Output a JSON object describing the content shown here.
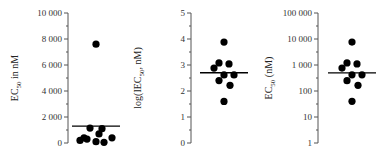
{
  "chart_data": [
    {
      "type": "scatter",
      "title": "",
      "ylabel": "EC50 in nM",
      "ylabel_parts": {
        "pre": "EC",
        "sub": "50",
        "post": " in nM"
      },
      "yscale": "linear",
      "ylim": [
        0,
        10000
      ],
      "yticks": [
        0,
        2000,
        4000,
        6000,
        8000,
        10000
      ],
      "ytick_labels": [
        "0",
        "2 000",
        "4 000",
        "6 000",
        "8 000",
        "10 000"
      ],
      "points": [
        7600,
        1150,
        1100,
        700,
        400,
        300,
        200,
        100,
        50,
        400
      ],
      "median_line": 1300,
      "grid": false
    },
    {
      "type": "scatter",
      "title": "",
      "ylabel": "log(IEC50, nM)",
      "ylabel_parts": {
        "pre": "log(IEC",
        "sub": "50",
        "post": ", nM)"
      },
      "yscale": "linear",
      "ylim": [
        0,
        5
      ],
      "yticks": [
        0,
        1,
        2,
        3,
        4,
        5
      ],
      "ytick_labels": [
        "0",
        "1",
        "2",
        "3",
        "4",
        "5"
      ],
      "points": [
        3.88,
        3.08,
        3.04,
        2.88,
        2.62,
        2.62,
        2.4,
        2.22,
        1.6
      ],
      "median_line": 2.7,
      "grid": false
    },
    {
      "type": "scatter",
      "title": "",
      "ylabel": "EC50 (nM)",
      "ylabel_parts": {
        "pre": "EC",
        "sub": "50",
        "post": " (nM)"
      },
      "yscale": "log",
      "ylim": [
        1,
        100000
      ],
      "yticks": [
        1,
        10,
        100,
        1000,
        10000,
        100000
      ],
      "ytick_labels": [
        "1",
        "10",
        "100",
        "1 000",
        "10 000",
        "100 000"
      ],
      "points": [
        7600,
        1200,
        1100,
        760,
        420,
        420,
        250,
        166,
        40
      ],
      "median_line": 500,
      "grid": false
    }
  ]
}
